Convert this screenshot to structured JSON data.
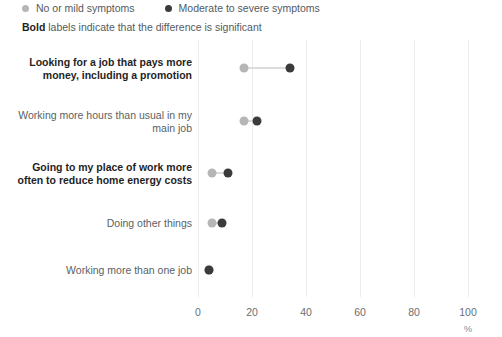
{
  "legend": {
    "items": [
      {
        "label": "No or mild symptoms",
        "color": "#b6b6b6"
      },
      {
        "label": "Moderate to severe symptoms",
        "color": "#3b3b3b"
      }
    ]
  },
  "caption": {
    "bold_word": "Bold",
    "rest": " labels indicate that the difference is significant"
  },
  "chart_data": {
    "type": "scatter",
    "subtype": "dumbbell",
    "title": "",
    "xlabel": "%",
    "ylabel": "",
    "xlim": [
      0,
      100
    ],
    "xticks": [
      0,
      20,
      40,
      60,
      80,
      100
    ],
    "xtick_labels": [
      "0",
      "20",
      "40",
      "60",
      "80",
      "100"
    ],
    "grid": "vertical",
    "legend_position": "top-left",
    "categories": [
      "Looking for a job that pays more money, including a promotion",
      "Working more hours than usual in my main job",
      "Going to my place of work more often to reduce home energy costs",
      "Doing other things",
      "Working more than one job"
    ],
    "significant": [
      true,
      false,
      true,
      false,
      false
    ],
    "series": [
      {
        "name": "No or mild symptoms",
        "color": "#b6b6b6",
        "values": [
          17,
          17,
          5,
          5,
          4
        ]
      },
      {
        "name": "Moderate to severe symptoms",
        "color": "#3b3b3b",
        "values": [
          34,
          22,
          11,
          9,
          4
        ]
      }
    ]
  }
}
